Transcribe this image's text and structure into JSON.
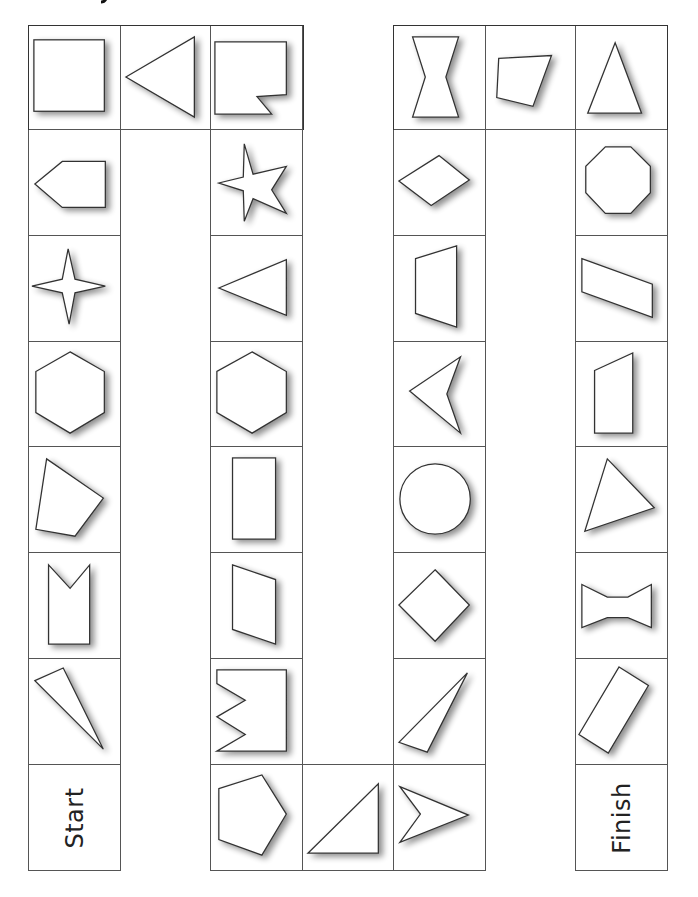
{
  "board": {
    "title_fragment": "y",
    "start_label": "Start",
    "finish_label": "Finish",
    "colors": {
      "line": "#333333",
      "cell_border": "#555555",
      "shadow": "#999999",
      "background": "#ffffff"
    },
    "path": [
      {
        "step": 0,
        "type": "start",
        "label": "Start"
      },
      {
        "step": 1,
        "shape": "kite-triangle-thin"
      },
      {
        "step": 2,
        "shape": "arrow-notched-rectangle"
      },
      {
        "step": 3,
        "shape": "irregular-quadrilateral"
      },
      {
        "step": 4,
        "shape": "hexagon"
      },
      {
        "step": 5,
        "shape": "four-point-star"
      },
      {
        "step": 6,
        "shape": "pentagon-arrow"
      },
      {
        "step": 7,
        "shape": "square"
      },
      {
        "step": 8,
        "shape": "triangle-left"
      },
      {
        "step": 9,
        "shape": "notched-square"
      },
      {
        "step": 10,
        "shape": "five-point-star"
      },
      {
        "step": 11,
        "shape": "triangle-left"
      },
      {
        "step": 12,
        "shape": "hexagon"
      },
      {
        "step": 13,
        "shape": "rectangle"
      },
      {
        "step": 14,
        "shape": "parallelogram"
      },
      {
        "step": 15,
        "shape": "zigzag-rectangle"
      },
      {
        "step": 16,
        "shape": "pentagon"
      },
      {
        "step": 17,
        "shape": "right-triangle"
      },
      {
        "step": 18,
        "shape": "arrowhead-right"
      },
      {
        "step": 19,
        "shape": "scalene-triangle"
      },
      {
        "step": 20,
        "shape": "square-diamond"
      },
      {
        "step": 21,
        "shape": "circle"
      },
      {
        "step": 22,
        "shape": "arrowhead-left"
      },
      {
        "step": 23,
        "shape": "trapezoid"
      },
      {
        "step": 24,
        "shape": "rhombus"
      },
      {
        "step": 25,
        "shape": "hourglass"
      },
      {
        "step": 26,
        "shape": "irregular-quadrilateral"
      },
      {
        "step": 27,
        "shape": "isosceles-triangle"
      },
      {
        "step": 28,
        "shape": "octagon"
      },
      {
        "step": 29,
        "shape": "parallelogram-slanted"
      },
      {
        "step": 30,
        "shape": "right-trapezoid"
      },
      {
        "step": 31,
        "shape": "triangle"
      },
      {
        "step": 32,
        "shape": "bowtie"
      },
      {
        "step": 33,
        "shape": "rotated-rectangle"
      },
      {
        "step": 34,
        "type": "finish",
        "label": "Finish"
      }
    ]
  }
}
